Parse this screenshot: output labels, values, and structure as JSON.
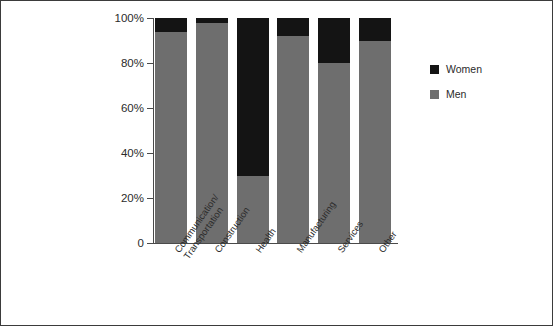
{
  "chart_data": {
    "type": "bar",
    "subtype": "stacked-100-percent",
    "title": "",
    "xlabel": "",
    "ylabel": "",
    "ylim": [
      0,
      100
    ],
    "ytick_labels": [
      "100%",
      "80%",
      "60%",
      "40%",
      "20%",
      "0"
    ],
    "ytick_values": [
      100,
      80,
      60,
      40,
      20,
      0
    ],
    "grid": false,
    "legend_position": "right",
    "categories": [
      "Communication/\nTransportation",
      "Construction",
      "Health",
      "Manufacturing",
      "Services",
      "Other"
    ],
    "series": [
      {
        "name": "Men",
        "color": "#6e6e6e",
        "values": [
          94,
          98,
          30,
          92,
          80,
          90
        ]
      },
      {
        "name": "Women",
        "color": "#141414",
        "values": [
          6,
          2,
          70,
          8,
          20,
          10
        ]
      }
    ]
  },
  "legend": {
    "items": [
      {
        "label": "Women",
        "color": "#141414"
      },
      {
        "label": "Men",
        "color": "#6e6e6e"
      }
    ]
  },
  "colors": {
    "men": "#6e6e6e",
    "women": "#141414",
    "axis": "#4a4a4a",
    "border": "#3b3b3b",
    "background": "#ffffff"
  }
}
